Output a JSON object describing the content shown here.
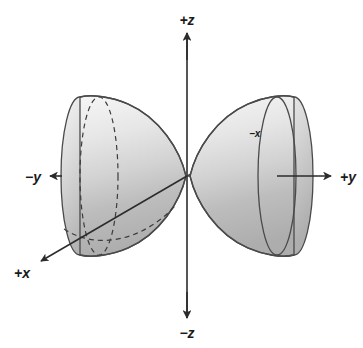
{
  "figure": {
    "kind": "3d-axis-diagram",
    "width": 363,
    "height": 348,
    "background_color": "#ffffff"
  },
  "colors": {
    "background": "#ffffff",
    "axis_line": "#2b2b2b",
    "outline": "#4a4a4a",
    "hidden_line": "#4a4a4a",
    "label_text": "#1a1a1a",
    "lobe_light": "#f2f2f2",
    "lobe_mid": "#d8d8d8",
    "lobe_dark": "#b0b0b0",
    "lobe_rim_light": "#ededed",
    "lobe_rim_dark": "#b8b8b8"
  },
  "origin": {
    "x": 187,
    "y": 176
  },
  "axes": [
    {
      "id": "z-positive",
      "label": "+z",
      "label_x": 187,
      "label_y": 25,
      "style": "solid",
      "arrow": "up",
      "from_x": 187,
      "from_y": 176,
      "to_x": 187,
      "to_y": 33
    },
    {
      "id": "z-negative",
      "label": "−z",
      "label_x": 187,
      "label_y": 336,
      "style": "solid",
      "arrow": "down",
      "from_x": 187,
      "from_y": 176,
      "to_x": 187,
      "to_y": 318
    },
    {
      "id": "y-positive",
      "label": "+y",
      "label_x": 347,
      "label_y": 181,
      "style": "solid",
      "arrow": "right",
      "from_x": 187,
      "from_y": 176,
      "to_x": 331,
      "to_y": 176
    },
    {
      "id": "y-negative",
      "label": "−y",
      "label_x": 27,
      "label_y": 181,
      "style": "solid",
      "arrow": "left",
      "from_x": 187,
      "from_y": 176,
      "to_x": 50,
      "to_y": 176
    },
    {
      "id": "x-positive",
      "label": "+x",
      "label_x": 25,
      "label_y": 275,
      "style": "solid",
      "arrow": "down-left",
      "from_x": 187,
      "from_y": 176,
      "to_x": 38,
      "to_y": 262
    },
    {
      "id": "x-negative",
      "label": "−x",
      "label_x": 256,
      "label_y": 136,
      "style": "dashed",
      "arrow": "up-right",
      "from_x": 187,
      "from_y": 176,
      "to_x": 249,
      "to_y": 140
    }
  ],
  "lobes": [
    {
      "id": "lobe-negative-y",
      "side": "left",
      "along_axis": "−y",
      "tip_x": 187,
      "tip_y": 176,
      "rim_center_x": 80,
      "rim_center_y": 176,
      "rim_rx": 19,
      "rim_ry": 79
    },
    {
      "id": "lobe-positive-y",
      "side": "right",
      "along_axis": "+y",
      "tip_x": 187,
      "tip_y": 176,
      "rim_center_x": 294,
      "rim_center_y": 176,
      "rim_rx": 19,
      "rim_ry": 79
    }
  ]
}
